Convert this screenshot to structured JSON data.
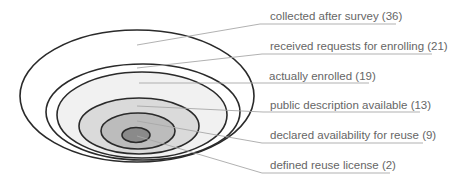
{
  "diagram": {
    "type": "nested-ellipses",
    "levels": [
      {
        "label": "collected after survey (36)",
        "count": 36,
        "fill": "#ffffff"
      },
      {
        "label": "received requests for enrolling (21)",
        "count": 21,
        "fill": "#ffffff"
      },
      {
        "label": "actually enrolled (19)",
        "count": 19,
        "fill": "#f2f2f2"
      },
      {
        "label": "public description available (13)",
        "count": 13,
        "fill": "#dcdcdc"
      },
      {
        "label": "declared availability for reuse (9)",
        "count": 9,
        "fill": "#bdbdbd"
      },
      {
        "label": "defined reuse license (2)",
        "count": 2,
        "fill": "#8c8c8c"
      }
    ],
    "stroke_color": "#2a2a2a",
    "leader_color": "#aaaaaa",
    "text_color": "#666666"
  }
}
